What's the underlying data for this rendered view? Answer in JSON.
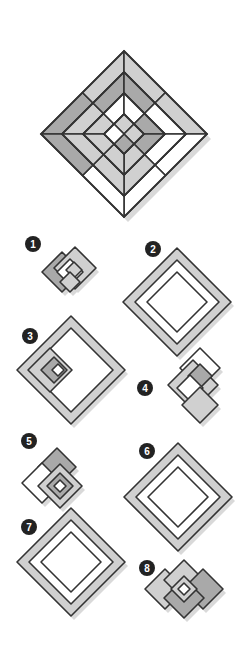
{
  "colors": {
    "stroke": "#333333",
    "dark": "#a9a9a9",
    "light": "#d0d0d0",
    "white": "#ffffff",
    "shadow": "#d9d9d9",
    "badge": "#222222"
  },
  "main_figure": {
    "cx": 124,
    "cy": 134,
    "r": 83,
    "rings": [
      83,
      62,
      41,
      20
    ],
    "cells": [
      {
        "ring": 0,
        "side": "nw",
        "part": "a",
        "fill": "dark"
      },
      {
        "ring": 0,
        "side": "nw",
        "part": "b",
        "fill": "light"
      },
      {
        "ring": 0,
        "side": "ne",
        "part": "a",
        "fill": "light"
      },
      {
        "ring": 0,
        "side": "ne",
        "part": "b",
        "fill": "light"
      },
      {
        "ring": 0,
        "side": "se",
        "part": "a",
        "fill": "white"
      },
      {
        "ring": 0,
        "side": "se",
        "part": "b",
        "fill": "white"
      },
      {
        "ring": 0,
        "side": "sw",
        "part": "a",
        "fill": "white"
      },
      {
        "ring": 0,
        "side": "sw",
        "part": "b",
        "fill": "dark"
      },
      {
        "ring": 1,
        "side": "nw",
        "part": "a",
        "fill": "light"
      },
      {
        "ring": 1,
        "side": "nw",
        "part": "b",
        "fill": "dark"
      },
      {
        "ring": 1,
        "side": "ne",
        "part": "a",
        "fill": "dark"
      },
      {
        "ring": 1,
        "side": "ne",
        "part": "b",
        "fill": "white"
      },
      {
        "ring": 1,
        "side": "se",
        "part": "a",
        "fill": "white"
      },
      {
        "ring": 1,
        "side": "se",
        "part": "b",
        "fill": "light"
      },
      {
        "ring": 1,
        "side": "sw",
        "part": "a",
        "fill": "light"
      },
      {
        "ring": 1,
        "side": "sw",
        "part": "b",
        "fill": "light"
      },
      {
        "ring": 2,
        "side": "nw",
        "part": "a",
        "fill": "light"
      },
      {
        "ring": 2,
        "side": "nw",
        "part": "b",
        "fill": "white"
      },
      {
        "ring": 2,
        "side": "ne",
        "part": "a",
        "fill": "white"
      },
      {
        "ring": 2,
        "side": "ne",
        "part": "b",
        "fill": "dark"
      },
      {
        "ring": 2,
        "side": "se",
        "part": "a",
        "fill": "dark"
      },
      {
        "ring": 2,
        "side": "se",
        "part": "b",
        "fill": "light"
      },
      {
        "ring": 2,
        "side": "sw",
        "part": "a",
        "fill": "light"
      },
      {
        "ring": 2,
        "side": "sw",
        "part": "b",
        "fill": "light"
      },
      {
        "ring": 3,
        "side": "n",
        "part": "q",
        "fill": "light"
      },
      {
        "ring": 3,
        "side": "e",
        "part": "q",
        "fill": "light"
      },
      {
        "ring": 3,
        "side": "s",
        "part": "q",
        "fill": "dark"
      },
      {
        "ring": 3,
        "side": "w",
        "part": "q",
        "fill": "white"
      }
    ]
  },
  "options": [
    {
      "label": "1",
      "badge": {
        "x": 33,
        "y": 244
      },
      "shapes": [
        {
          "cx": 62,
          "cy": 272,
          "r": 20,
          "fill": "dark"
        },
        {
          "cx": 75,
          "cy": 268,
          "r": 21,
          "fill": "light"
        },
        {
          "cx": 70,
          "cy": 272,
          "r": 13,
          "fill": "white"
        },
        {
          "cx": 74,
          "cy": 270,
          "r": 8,
          "fill": "light"
        },
        {
          "cx": 70,
          "cy": 282,
          "r": 10,
          "fill": "light"
        }
      ]
    },
    {
      "label": "2",
      "badge": {
        "x": 153,
        "y": 249
      },
      "shapes": [
        {
          "cx": 177,
          "cy": 302,
          "r": 54,
          "fill": "light"
        },
        {
          "cx": 177,
          "cy": 302,
          "r": 42,
          "fill": "white"
        },
        {
          "cx": 177,
          "cy": 302,
          "r": 30,
          "fill": "white"
        }
      ]
    },
    {
      "label": "3",
      "badge": {
        "x": 30,
        "y": 336
      },
      "shapes": [
        {
          "cx": 71,
          "cy": 370,
          "r": 54,
          "fill": "light"
        },
        {
          "cx": 71,
          "cy": 370,
          "r": 42,
          "fill": "white"
        },
        {
          "cx": 50,
          "cy": 370,
          "r": 22,
          "fill": "light"
        },
        {
          "cx": 54,
          "cy": 370,
          "r": 13,
          "fill": "dark"
        },
        {
          "cx": 58,
          "cy": 370,
          "r": 6,
          "fill": "white"
        }
      ]
    },
    {
      "label": "4",
      "badge": {
        "x": 145,
        "y": 388
      },
      "shapes": [
        {
          "cx": 200,
          "cy": 368,
          "r": 20,
          "fill": "white"
        },
        {
          "cx": 193,
          "cy": 385,
          "r": 25,
          "fill": "light"
        },
        {
          "cx": 200,
          "cy": 376,
          "r": 12,
          "fill": "dark"
        },
        {
          "cx": 190,
          "cy": 388,
          "r": 13,
          "fill": "white"
        },
        {
          "cx": 200,
          "cy": 405,
          "r": 18,
          "fill": "light"
        }
      ]
    },
    {
      "label": "5",
      "badge": {
        "x": 29,
        "y": 441
      },
      "shapes": [
        {
          "cx": 57,
          "cy": 467,
          "r": 19,
          "fill": "dark"
        },
        {
          "cx": 42,
          "cy": 483,
          "r": 20,
          "fill": "white"
        },
        {
          "cx": 60,
          "cy": 486,
          "r": 22,
          "fill": "light"
        },
        {
          "cx": 60,
          "cy": 486,
          "r": 13,
          "fill": "dark"
        },
        {
          "cx": 60,
          "cy": 486,
          "r": 6,
          "fill": "white"
        }
      ]
    },
    {
      "label": "6",
      "badge": {
        "x": 147,
        "y": 451
      },
      "shapes": [
        {
          "cx": 178,
          "cy": 497,
          "r": 54,
          "fill": "light"
        },
        {
          "cx": 178,
          "cy": 497,
          "r": 42,
          "fill": "white"
        },
        {
          "cx": 178,
          "cy": 497,
          "r": 30,
          "fill": "white"
        }
      ]
    },
    {
      "label": "7",
      "badge": {
        "x": 29,
        "y": 527
      },
      "shapes": [
        {
          "cx": 71,
          "cy": 562,
          "r": 54,
          "fill": "light"
        },
        {
          "cx": 71,
          "cy": 562,
          "r": 42,
          "fill": "white"
        },
        {
          "cx": 71,
          "cy": 562,
          "r": 30,
          "fill": "white"
        }
      ]
    },
    {
      "label": "8",
      "badge": {
        "x": 147,
        "y": 568
      },
      "shapes": [
        {
          "cx": 165,
          "cy": 589,
          "r": 20,
          "fill": "light"
        },
        {
          "cx": 184,
          "cy": 580,
          "r": 20,
          "fill": "light"
        },
        {
          "cx": 203,
          "cy": 589,
          "r": 20,
          "fill": "dark"
        },
        {
          "cx": 184,
          "cy": 598,
          "r": 20,
          "fill": "dark"
        },
        {
          "cx": 184,
          "cy": 589,
          "r": 13,
          "fill": "light"
        },
        {
          "cx": 184,
          "cy": 589,
          "r": 6,
          "fill": "white"
        }
      ]
    }
  ]
}
